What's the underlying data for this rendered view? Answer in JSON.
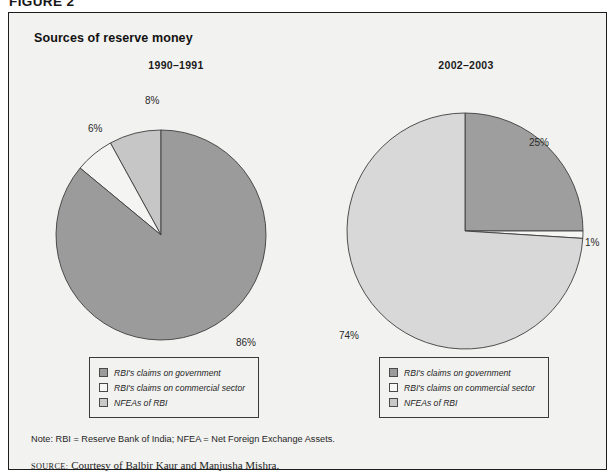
{
  "figure": {
    "label": "FIGURE 2",
    "panel_title": "Sources of reserve money"
  },
  "colors": {
    "government_claims": "#9b9b9b",
    "commercial_claims": "#f4f4f2",
    "nfea": "#c6c6c6",
    "government_claims_right": "#9e9e9e",
    "nfea_right": "#d8d8d8",
    "outline": "#3d3d3d",
    "frame": "#1d1d1d",
    "panel_background": "#f2f2f0"
  },
  "legend": {
    "items": [
      {
        "label": "RBI's claims on government",
        "swatch": "#9b9b9b"
      },
      {
        "label": "RBI's claims on commercial sector",
        "swatch": "#f8f8f6"
      },
      {
        "label": "NFEAs of RBI",
        "swatch": "#c8c8c8"
      }
    ]
  },
  "footnotes": {
    "note": "Note: RBI = Reserve Bank of India; NFEA = Net Foreign Exchange Assets.",
    "source_keyword": "source:",
    "source_text": "Courtesy of Balbir Kaur and Manjusha Mishra."
  },
  "chart_data": [
    {
      "type": "pie",
      "title": "1990–1991",
      "categories": [
        "RBI's claims on government",
        "RBI's claims on commercial sector",
        "NFEAs of RBI"
      ],
      "values": [
        86,
        6,
        8
      ],
      "labels": [
        "86%",
        "6%",
        "8%"
      ],
      "colors": [
        "#9b9b9b",
        "#f4f4f2",
        "#c6c6c6"
      ],
      "start_angle_deg": 0,
      "direction": "counterclockwise",
      "legend_position": "below"
    },
    {
      "type": "pie",
      "title": "2002–2003",
      "categories": [
        "RBI's claims on government",
        "RBI's claims on commercial sector",
        "NFEAs of RBI"
      ],
      "values": [
        25,
        1,
        74
      ],
      "labels": [
        "25%",
        "1%",
        "74%"
      ],
      "colors": [
        "#9e9e9e",
        "#f6f6f4",
        "#d8d8d8"
      ],
      "start_angle_deg": 0,
      "direction": "clockwise",
      "legend_position": "below"
    }
  ]
}
